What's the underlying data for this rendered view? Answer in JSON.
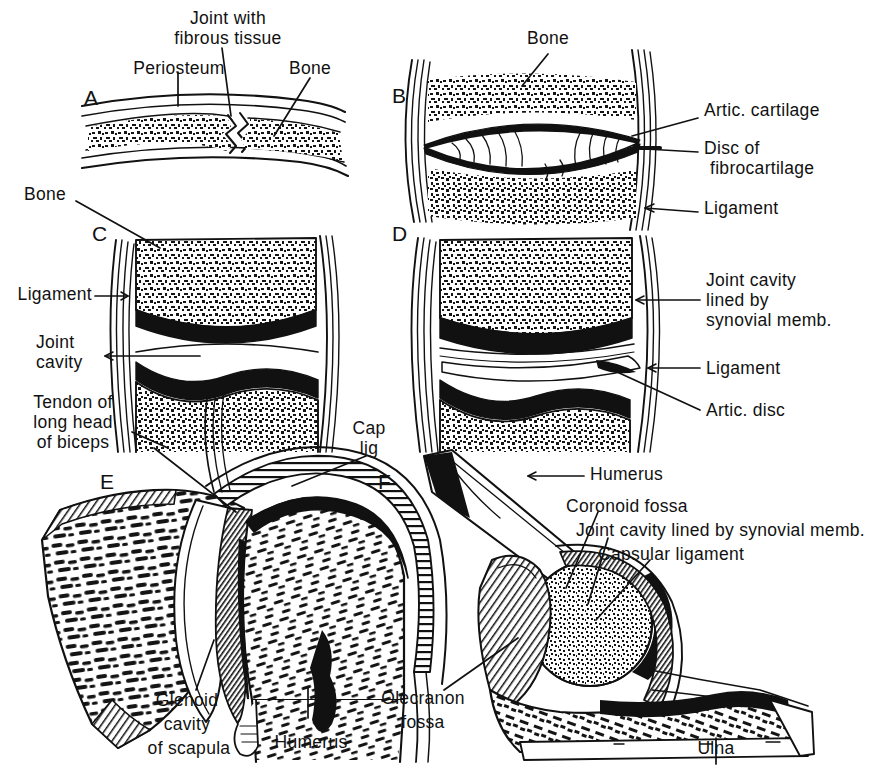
{
  "figure": {
    "ink_color": "#111111",
    "background_color": "#ffffff",
    "panel_count": 6
  },
  "panels": [
    {
      "letter": "A",
      "name": "fibrous-joint",
      "labels": [
        {
          "key": "periosteum",
          "text": "Periosteum"
        },
        {
          "key": "joint_fibrous",
          "text": "Joint with\nfibrous tissue"
        },
        {
          "key": "bone",
          "text": "Bone"
        }
      ]
    },
    {
      "letter": "B",
      "name": "cartilaginous-joint",
      "labels": [
        {
          "key": "bone",
          "text": "Bone"
        },
        {
          "key": "artic_cartilage",
          "text": "Artic. cartilage"
        },
        {
          "key": "disc_fibro",
          "text": "Disc of\nfibrocartilage"
        },
        {
          "key": "ligament",
          "text": "Ligament"
        }
      ]
    },
    {
      "letter": "C",
      "name": "simple-synovial-joint",
      "labels": [
        {
          "key": "bone",
          "text": "Bone"
        },
        {
          "key": "ligament",
          "text": "Ligament"
        },
        {
          "key": "joint_cavity",
          "text": "Joint\ncavity"
        }
      ]
    },
    {
      "letter": "D",
      "name": "synovial-joint-with-disc",
      "labels": [
        {
          "key": "joint_cavity_syn",
          "text": "Joint cavity\nlined by\nsynovial memb."
        },
        {
          "key": "ligament",
          "text": "Ligament"
        },
        {
          "key": "artic_disc",
          "text": "Artic. disc"
        }
      ]
    },
    {
      "letter": "E",
      "name": "shoulder-joint",
      "labels": [
        {
          "key": "tendon_biceps",
          "text": "Tendon of\nlong head\nof biceps"
        },
        {
          "key": "cap_lig",
          "text": "Cap\nlig"
        },
        {
          "key": "glenoid",
          "text": "Glenoid\ncavity\nof scapula"
        },
        {
          "key": "humerus",
          "text": "Humerus"
        }
      ]
    },
    {
      "letter": "F",
      "name": "elbow-joint",
      "labels": [
        {
          "key": "humerus",
          "text": "Humerus"
        },
        {
          "key": "coronoid_fossa",
          "text": "Coronoid fossa"
        },
        {
          "key": "joint_cavity_syn",
          "text": "Joint cavity lined by synovial memb."
        },
        {
          "key": "capsular_lig",
          "text": "Capsular ligament"
        },
        {
          "key": "olecranon_fossa",
          "text": "Olecranon\nfossa"
        },
        {
          "key": "ulna",
          "text": "Ulna"
        }
      ]
    }
  ],
  "labels": {
    "a_periosteum": "Periosteum",
    "a_joint_fibrous_1": "Joint with",
    "a_joint_fibrous_2": "fibrous tissue",
    "a_bone": "Bone",
    "b_bone": "Bone",
    "b_artic_cartilage": "Artic. cartilage",
    "b_disc_1": "Disc of",
    "b_disc_2": "fibrocartilage",
    "b_ligament": "Ligament",
    "c_bone": "Bone",
    "c_ligament": "Ligament",
    "c_joint_1": "Joint",
    "c_joint_2": "cavity",
    "c_tendon_1": "Tendon of",
    "c_tendon_2": "long head",
    "c_tendon_3": "of biceps",
    "d_jc_1": "Joint cavity",
    "d_jc_2": "lined by",
    "d_jc_3": "synovial memb.",
    "d_ligament": "Ligament",
    "d_artic_disc": "Artic. disc",
    "e_cap_1": "Cap",
    "e_cap_2": "lig",
    "e_glenoid_1": "Glenoid",
    "e_glenoid_2": "cavity",
    "e_glenoid_3": "of scapula",
    "e_humerus": "Humerus",
    "f_humerus": "Humerus",
    "f_coronoid": "Coronoid fossa",
    "f_jointcav": "Joint cavity lined by synovial memb.",
    "f_capsular": "Capsular ligament",
    "f_olecranon_1": "Olecranon",
    "f_olecranon_2": "fossa",
    "f_ulna": "Ulna",
    "letter_a": "A",
    "letter_b": "B",
    "letter_c": "C",
    "letter_d": "D",
    "letter_e": "E",
    "letter_f": "F"
  }
}
